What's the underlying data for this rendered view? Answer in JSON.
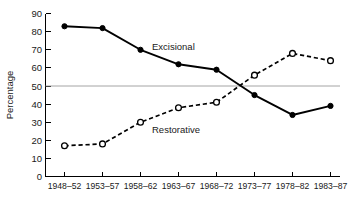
{
  "chart_data": {
    "type": "line",
    "title": "",
    "xlabel": "",
    "ylabel": "Percentage",
    "categories": [
      "1948–52",
      "1953–57",
      "1958–62",
      "1963–67",
      "1968–72",
      "1973–77",
      "1978–82",
      "1983–87"
    ],
    "series": [
      {
        "name": "Excisional",
        "values": [
          83,
          82,
          70,
          62,
          59,
          45,
          34,
          39
        ],
        "marker": "filled-circle",
        "linestyle": "solid",
        "color": "#000000",
        "label_text": "Excisional"
      },
      {
        "name": "Restorative",
        "values": [
          17,
          18,
          30,
          38,
          41,
          56,
          68,
          64
        ],
        "marker": "open-circle",
        "linestyle": "dashed",
        "color": "#000000",
        "label_text": "Restorative"
      }
    ],
    "yticks": [
      0,
      10,
      20,
      30,
      40,
      50,
      60,
      70,
      80,
      90
    ],
    "ylim": [
      0,
      90
    ],
    "grid": false,
    "reference_line": 50,
    "legend": "inline-annotations"
  },
  "axes": {
    "y_title": "Percentage",
    "y_tick_labels": [
      "0",
      "10",
      "20",
      "30",
      "40",
      "50",
      "60",
      "70",
      "80",
      "90"
    ],
    "x_tick_labels": [
      "1948–52",
      "1953–57",
      "1958–62",
      "1963–67",
      "1968–72",
      "1973–77",
      "1978–82",
      "1983–87"
    ]
  },
  "annotations": {
    "excisional": "Excisional",
    "restorative": "Restorative"
  },
  "colors": {
    "ink": "#000000",
    "reference_line": "#9a9a9a",
    "background": "#ffffff"
  }
}
